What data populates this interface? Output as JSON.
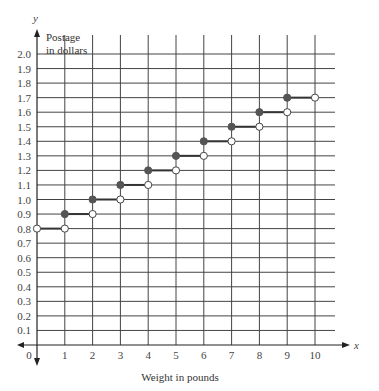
{
  "chart_data": {
    "type": "line",
    "subtype": "step-function",
    "title": "",
    "xlabel": "Weight in pounds",
    "ylabel": "Postage in dollars",
    "x_axis_variable": "x",
    "y_axis_variable": "y",
    "xlim": [
      0,
      10
    ],
    "ylim": [
      0,
      2.0
    ],
    "x_ticks": [
      "0",
      "1",
      "2",
      "3",
      "4",
      "5",
      "6",
      "7",
      "8",
      "9",
      "10"
    ],
    "y_ticks": [
      "0.1",
      "0.2",
      "0.3",
      "0.4",
      "0.5",
      "0.6",
      "0.7",
      "0.8",
      "0.9",
      "1.0",
      "1.1",
      "1.2",
      "1.3",
      "1.4",
      "1.5",
      "1.6",
      "1.7",
      "1.8",
      "1.9",
      "2.0"
    ],
    "grid": true,
    "legend": null,
    "segments": [
      {
        "x_start": 0,
        "x_end": 1,
        "y": 0.8,
        "start_closed": false,
        "end_closed": false
      },
      {
        "x_start": 1,
        "x_end": 2,
        "y": 0.9,
        "start_closed": true,
        "end_closed": false
      },
      {
        "x_start": 2,
        "x_end": 3,
        "y": 1.0,
        "start_closed": true,
        "end_closed": false
      },
      {
        "x_start": 3,
        "x_end": 4,
        "y": 1.1,
        "start_closed": true,
        "end_closed": false
      },
      {
        "x_start": 4,
        "x_end": 5,
        "y": 1.2,
        "start_closed": true,
        "end_closed": false
      },
      {
        "x_start": 5,
        "x_end": 6,
        "y": 1.3,
        "start_closed": true,
        "end_closed": false
      },
      {
        "x_start": 6,
        "x_end": 7,
        "y": 1.4,
        "start_closed": true,
        "end_closed": false
      },
      {
        "x_start": 7,
        "x_end": 8,
        "y": 1.5,
        "start_closed": true,
        "end_closed": false
      },
      {
        "x_start": 8,
        "x_end": 9,
        "y": 1.6,
        "start_closed": true,
        "end_closed": false
      },
      {
        "x_start": 9,
        "x_end": 10,
        "y": 1.7,
        "start_closed": true,
        "end_closed": false
      }
    ]
  },
  "labels": {
    "y_var": "y",
    "x_var": "x",
    "ylabel_line1": "Postage",
    "ylabel_line2": "in dollars",
    "xlabel": "Weight in pounds"
  },
  "colors": {
    "grid": "#444444",
    "axis": "#222222",
    "step_line": "#333333",
    "closed_dot": "#555555",
    "open_dot_fill": "#ffffff"
  }
}
